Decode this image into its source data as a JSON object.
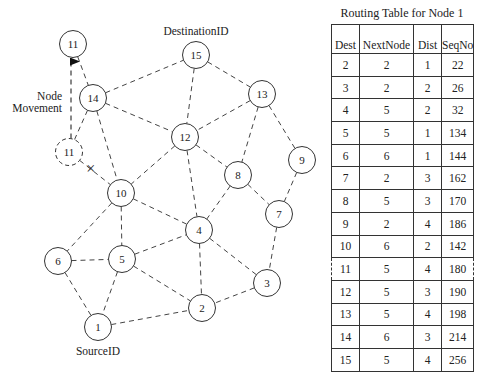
{
  "diagram": {
    "labels": {
      "destination": "DestinationID",
      "source": "SourceID",
      "movement_line1": "Node",
      "movement_line2": "Movement",
      "break_mark": "×"
    },
    "nodes": [
      {
        "id": "11",
        "x": 73,
        "y": 44,
        "style": "solid",
        "note": "new position"
      },
      {
        "id": "14",
        "x": 93,
        "y": 98,
        "style": "solid"
      },
      {
        "id": "11",
        "x": 69,
        "y": 152,
        "style": "dashed",
        "note": "old position"
      },
      {
        "id": "15",
        "x": 196,
        "y": 55,
        "style": "solid"
      },
      {
        "id": "13",
        "x": 262,
        "y": 94,
        "style": "solid"
      },
      {
        "id": "12",
        "x": 185,
        "y": 137,
        "style": "solid"
      },
      {
        "id": "9",
        "x": 302,
        "y": 160,
        "style": "solid"
      },
      {
        "id": "8",
        "x": 238,
        "y": 175,
        "style": "solid"
      },
      {
        "id": "10",
        "x": 121,
        "y": 193,
        "style": "solid"
      },
      {
        "id": "7",
        "x": 279,
        "y": 214,
        "style": "solid"
      },
      {
        "id": "4",
        "x": 199,
        "y": 230,
        "style": "solid"
      },
      {
        "id": "6",
        "x": 58,
        "y": 261,
        "style": "solid"
      },
      {
        "id": "5",
        "x": 122,
        "y": 259,
        "style": "solid"
      },
      {
        "id": "3",
        "x": 267,
        "y": 283,
        "style": "solid"
      },
      {
        "id": "2",
        "x": 202,
        "y": 308,
        "style": "solid"
      },
      {
        "id": "1",
        "x": 98,
        "y": 327,
        "style": "solid"
      }
    ],
    "edges": [
      [
        "11",
        "14"
      ],
      [
        "14",
        "15"
      ],
      [
        "14",
        "12"
      ],
      [
        "14",
        "10"
      ],
      [
        "14",
        "11-old"
      ],
      [
        "11-old",
        "10"
      ],
      [
        "15",
        "13"
      ],
      [
        "15",
        "12"
      ],
      [
        "13",
        "12"
      ],
      [
        "13",
        "8"
      ],
      [
        "13",
        "9"
      ],
      [
        "12",
        "10"
      ],
      [
        "12",
        "8"
      ],
      [
        "12",
        "4"
      ],
      [
        "9",
        "7"
      ],
      [
        "8",
        "7"
      ],
      [
        "8",
        "4"
      ],
      [
        "10",
        "4"
      ],
      [
        "10",
        "6"
      ],
      [
        "10",
        "5"
      ],
      [
        "6",
        "5"
      ],
      [
        "6",
        "1"
      ],
      [
        "5",
        "1"
      ],
      [
        "5",
        "4"
      ],
      [
        "5",
        "2"
      ],
      [
        "4",
        "2"
      ],
      [
        "4",
        "3"
      ],
      [
        "7",
        "3"
      ],
      [
        "3",
        "2"
      ],
      [
        "1",
        "2"
      ]
    ],
    "broken_link": [
      "11-old",
      "10"
    ],
    "movement_arrow": {
      "from": "11-old",
      "to": "11"
    }
  },
  "routing_table": {
    "title": "Routing Table for Node 1",
    "columns": [
      "Dest",
      "NextNode",
      "Dist",
      "SeqNo"
    ],
    "rows": [
      {
        "dest": "2",
        "next": "2",
        "dist": "1",
        "seq": "22"
      },
      {
        "dest": "3",
        "next": "2",
        "dist": "2",
        "seq": "26"
      },
      {
        "dest": "4",
        "next": "5",
        "dist": "2",
        "seq": "32"
      },
      {
        "dest": "5",
        "next": "5",
        "dist": "1",
        "seq": "134"
      },
      {
        "dest": "6",
        "next": "6",
        "dist": "1",
        "seq": "144"
      },
      {
        "dest": "7",
        "next": "2",
        "dist": "3",
        "seq": "162"
      },
      {
        "dest": "8",
        "next": "5",
        "dist": "3",
        "seq": "170"
      },
      {
        "dest": "9",
        "next": "2",
        "dist": "4",
        "seq": "186"
      },
      {
        "dest": "10",
        "next": "6",
        "dist": "2",
        "seq": "142"
      },
      {
        "dest": "11",
        "next": "5",
        "dist": "4",
        "seq": "180",
        "highlighted": true
      },
      {
        "dest": "12",
        "next": "5",
        "dist": "3",
        "seq": "190"
      },
      {
        "dest": "13",
        "next": "5",
        "dist": "4",
        "seq": "198"
      },
      {
        "dest": "14",
        "next": "6",
        "dist": "3",
        "seq": "214"
      },
      {
        "dest": "15",
        "next": "5",
        "dist": "4",
        "seq": "256"
      }
    ]
  }
}
